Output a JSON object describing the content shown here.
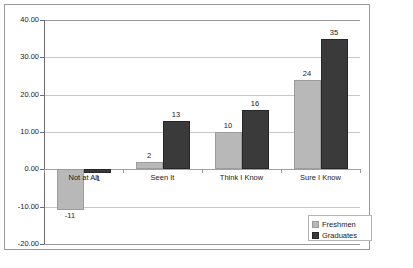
{
  "chart_data": {
    "type": "bar",
    "title": "",
    "subtitle": "",
    "xlabel": "",
    "ylabel": "",
    "categories": [
      "Not at All",
      "Seen It",
      "Think I Know",
      "Sure I Know"
    ],
    "series": [
      {
        "name": "Freshmen",
        "color": "#b8b8b8",
        "values": [
          -11,
          2,
          10,
          24
        ]
      },
      {
        "name": "Graduates",
        "color": "#3a3a3a",
        "values": [
          -1,
          13,
          16,
          35
        ]
      }
    ],
    "ylim": [
      -20,
      40
    ],
    "ytick_step": 10,
    "ytick_labels": [
      "40.00",
      "30.00",
      "20.00",
      "10.00",
      "0.00",
      "-10.00",
      "-20.00"
    ],
    "ytick_values": [
      40,
      30,
      20,
      10,
      0,
      -10,
      -20
    ],
    "data_labels": {
      "Freshmen": [
        "-11",
        "2",
        "10",
        "24"
      ],
      "Graduates": [
        "-1",
        "13",
        "16",
        "35"
      ]
    },
    "grid": true,
    "legend_position": "bottom-right",
    "legend_entries": [
      "Freshmen",
      "Graduates"
    ]
  }
}
